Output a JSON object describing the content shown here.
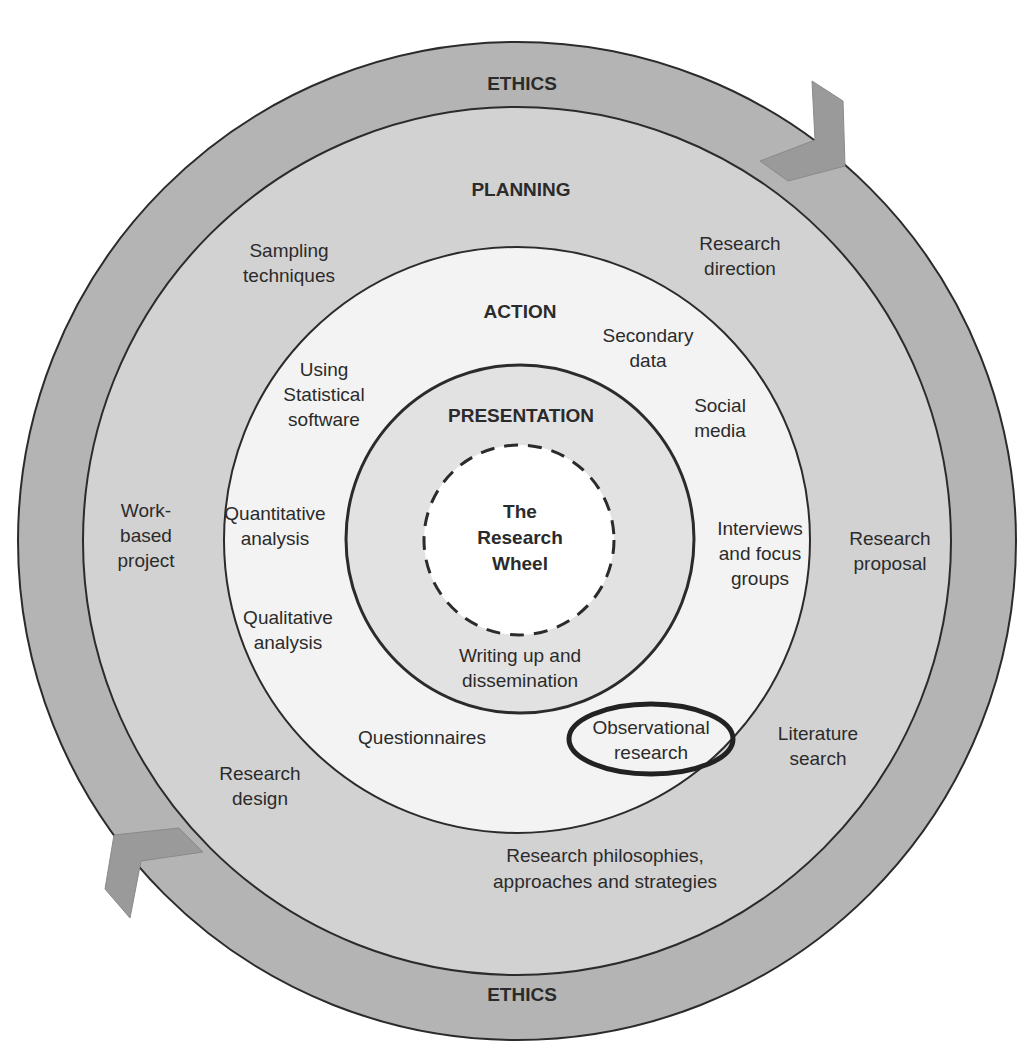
{
  "diagram": {
    "title": "The Research Wheel",
    "center": {
      "lines": [
        "The",
        "Research",
        "Wheel"
      ]
    },
    "colors": {
      "ethics_ring": "#b4b4b4",
      "planning_ring": "#d2d2d2",
      "action_ring": "#f3f3f3",
      "presentation_ring": "#e2e2e2",
      "center": "#ffffff",
      "arrow": "#9a9a9a",
      "stroke": "#2b2b2b"
    },
    "rings": {
      "ethics": {
        "label_top": "ETHICS",
        "label_bottom": "ETHICS"
      },
      "planning": {
        "label": "PLANNING",
        "items": [
          {
            "name": "sampling-techniques",
            "lines": [
              "Sampling",
              "techniques"
            ]
          },
          {
            "name": "research-direction",
            "lines": [
              "Research",
              "direction"
            ]
          },
          {
            "name": "work-based-project",
            "lines": [
              "Work-",
              "based",
              "project"
            ]
          },
          {
            "name": "research-proposal",
            "lines": [
              "Research",
              "proposal"
            ]
          },
          {
            "name": "research-design",
            "lines": [
              "Research",
              "design"
            ]
          },
          {
            "name": "literature-search",
            "lines": [
              "Literature",
              "search"
            ]
          },
          {
            "name": "research-philosophies",
            "lines": [
              "Research philosophies,",
              "approaches and strategies"
            ]
          }
        ]
      },
      "action": {
        "label": "ACTION",
        "items": [
          {
            "name": "secondary-data",
            "lines": [
              "Secondary",
              "data"
            ]
          },
          {
            "name": "using-statistical-software",
            "lines": [
              "Using",
              "Statistical",
              "software"
            ]
          },
          {
            "name": "social-media",
            "lines": [
              "Social",
              "media"
            ]
          },
          {
            "name": "quantitative-analysis",
            "lines": [
              "Quantitative",
              "analysis"
            ]
          },
          {
            "name": "interviews-focus-groups",
            "lines": [
              "Interviews",
              "and focus",
              "groups"
            ]
          },
          {
            "name": "qualitative-analysis",
            "lines": [
              "Qualitative",
              "analysis"
            ]
          },
          {
            "name": "questionnaires",
            "lines": [
              "Questionnaires"
            ]
          },
          {
            "name": "observational-research",
            "lines": [
              "Observational",
              "research"
            ],
            "highlighted": true
          }
        ]
      },
      "presentation": {
        "label": "PRESENTATION",
        "items": [
          {
            "name": "writing-up-dissemination",
            "lines": [
              "Writing up and",
              "dissemination"
            ]
          }
        ]
      }
    }
  }
}
